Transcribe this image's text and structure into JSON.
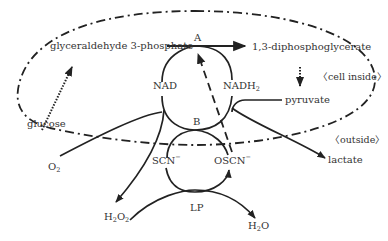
{
  "diagram": {
    "regions": {
      "inside": "〈cell inside〉",
      "outside": "〈outside〉"
    },
    "nodes": {
      "g3p": "glyceraldehyde 3-phosphate",
      "dpg": "1,3-diphosphoglycerate",
      "A": "A",
      "B": "B",
      "nad": "NAD",
      "nadh2_main": "NADH",
      "nadh2_sub": "2",
      "pyruvate": "pyruvate",
      "glucose": "glucose",
      "lactate": "lactate",
      "o2_main": "O",
      "o2_sub": "2",
      "scn_main": "SCN",
      "scn_sup": "−",
      "oscn_main": "OSCN",
      "oscn_sup": "−",
      "lp": "LP",
      "h2o2_a": "H",
      "h2o2_s1": "2",
      "h2o2_b": "O",
      "h2o2_s2": "2",
      "h2o_a": "H",
      "h2o_s": "2",
      "h2o_b": "O"
    },
    "colors": {
      "stroke": "#222222",
      "text": "#333333",
      "background": "#ffffff"
    }
  }
}
